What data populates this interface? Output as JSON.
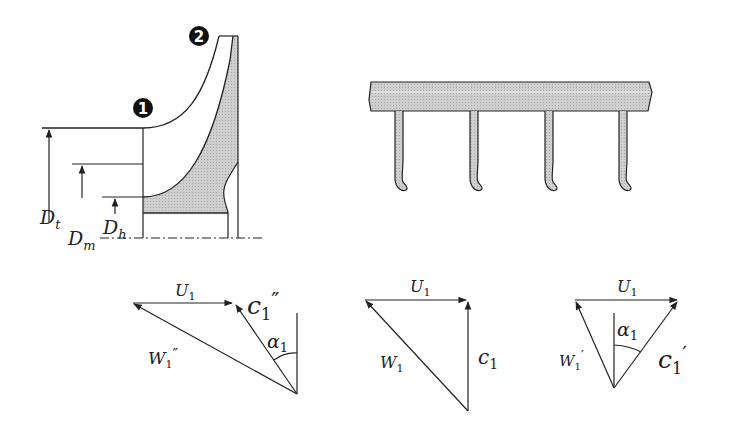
{
  "colors": {
    "line": "#222222",
    "shade": "#c9c9c9",
    "badge": "#111111",
    "background": "#ffffff"
  },
  "impeller": {
    "station_1": "1",
    "station_2": "2",
    "dimensions": [
      {
        "symbol": "D",
        "subscript": "t"
      },
      {
        "symbol": "D",
        "subscript": "m"
      },
      {
        "symbol": "D",
        "subscript": "h"
      }
    ]
  },
  "blade_cascade": {
    "blade_count": 4
  },
  "velocity_triangles": [
    {
      "id": "left",
      "u": {
        "symbol": "U",
        "subscript": "1"
      },
      "c": {
        "symbol": "c",
        "subscript": "1",
        "prime": "″"
      },
      "w": {
        "symbol": "W",
        "subscript": "1",
        "prime": "″"
      },
      "angle": {
        "symbol": "α",
        "subscript": "1"
      }
    },
    {
      "id": "middle",
      "u": {
        "symbol": "U",
        "subscript": "1"
      },
      "c": {
        "symbol": "c",
        "subscript": "1",
        "prime": ""
      },
      "w": {
        "symbol": "W",
        "subscript": "1",
        "prime": ""
      }
    },
    {
      "id": "right",
      "u": {
        "symbol": "U",
        "subscript": "1"
      },
      "c": {
        "symbol": "c",
        "subscript": "1",
        "prime": "′"
      },
      "w": {
        "symbol": "W",
        "subscript": "1",
        "prime": "′"
      },
      "angle": {
        "symbol": "α",
        "subscript": "1"
      }
    }
  ]
}
